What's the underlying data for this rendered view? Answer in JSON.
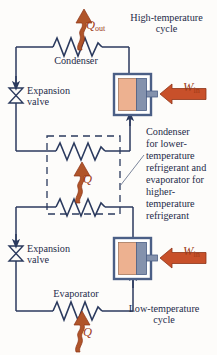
{
  "diagram": {
    "colors": {
      "line": "#2b3a5e",
      "heat_arrow": "#b0552a",
      "heat_arrow_dark": "#9e3b18",
      "work_arrow": "#c8502a",
      "cylinder_gas": "#edb190",
      "cylinder_piston": "#7b8aa8",
      "cylinder_body": "#4b5f86",
      "text": "#1e2b49",
      "background": "#fdfcfa"
    },
    "labels": {
      "high_temperature_cycle": "High-temperature\ncycle",
      "low_temperature_cycle": "Low-temperature\ncycle",
      "condenser": "Condenser",
      "evaporator": "Evaporator",
      "expansion_valve_top": "Expansion\nvalve",
      "expansion_valve_bottom": "Expansion\nvalve",
      "middle_heat_exchanger": "Condenser\nfor lower-\ntemperature\nrefrigerant and\nevaporator for\nhigher-\ntemperature\nrefrigerant"
    },
    "symbols": {
      "q_out": "Q",
      "q_out_sub": "out",
      "w_in_top": "W",
      "w_in_top_sub": "in",
      "q_middle": "Q",
      "w_in_bottom": "W",
      "w_in_bottom_sub": "in",
      "q_bottom": "Q"
    },
    "components": [
      {
        "name": "condenser-coil",
        "type": "heat-exchanger-coil",
        "cycle": "high-temperature"
      },
      {
        "name": "expansion-valve-top",
        "type": "expansion-valve",
        "cycle": "high-temperature"
      },
      {
        "name": "compressor-top",
        "type": "piston-cylinder-compressor",
        "cycle": "high-temperature"
      },
      {
        "name": "cascade-condenser-coil",
        "type": "heat-exchanger-coil",
        "cycle": "cascade"
      },
      {
        "name": "cascade-evaporator-coil",
        "type": "heat-exchanger-coil",
        "cycle": "cascade"
      },
      {
        "name": "expansion-valve-bottom",
        "type": "expansion-valve",
        "cycle": "low-temperature"
      },
      {
        "name": "compressor-bottom",
        "type": "piston-cylinder-compressor",
        "cycle": "low-temperature"
      },
      {
        "name": "evaporator-coil",
        "type": "heat-exchanger-coil",
        "cycle": "low-temperature"
      }
    ]
  }
}
